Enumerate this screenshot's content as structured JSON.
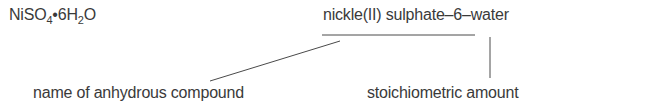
{
  "formula": {
    "base": "NiSO",
    "sub1": "4",
    "dot": "•",
    "mid": "6H",
    "sub2": "2",
    "end": "O"
  },
  "systematic_name": "nickle(II) sulphate–6–water",
  "annotations": [
    {
      "label": "name of anhydrous compound"
    },
    {
      "label": "stoichiometric amount"
    }
  ],
  "line_color": "#4a4a4a"
}
